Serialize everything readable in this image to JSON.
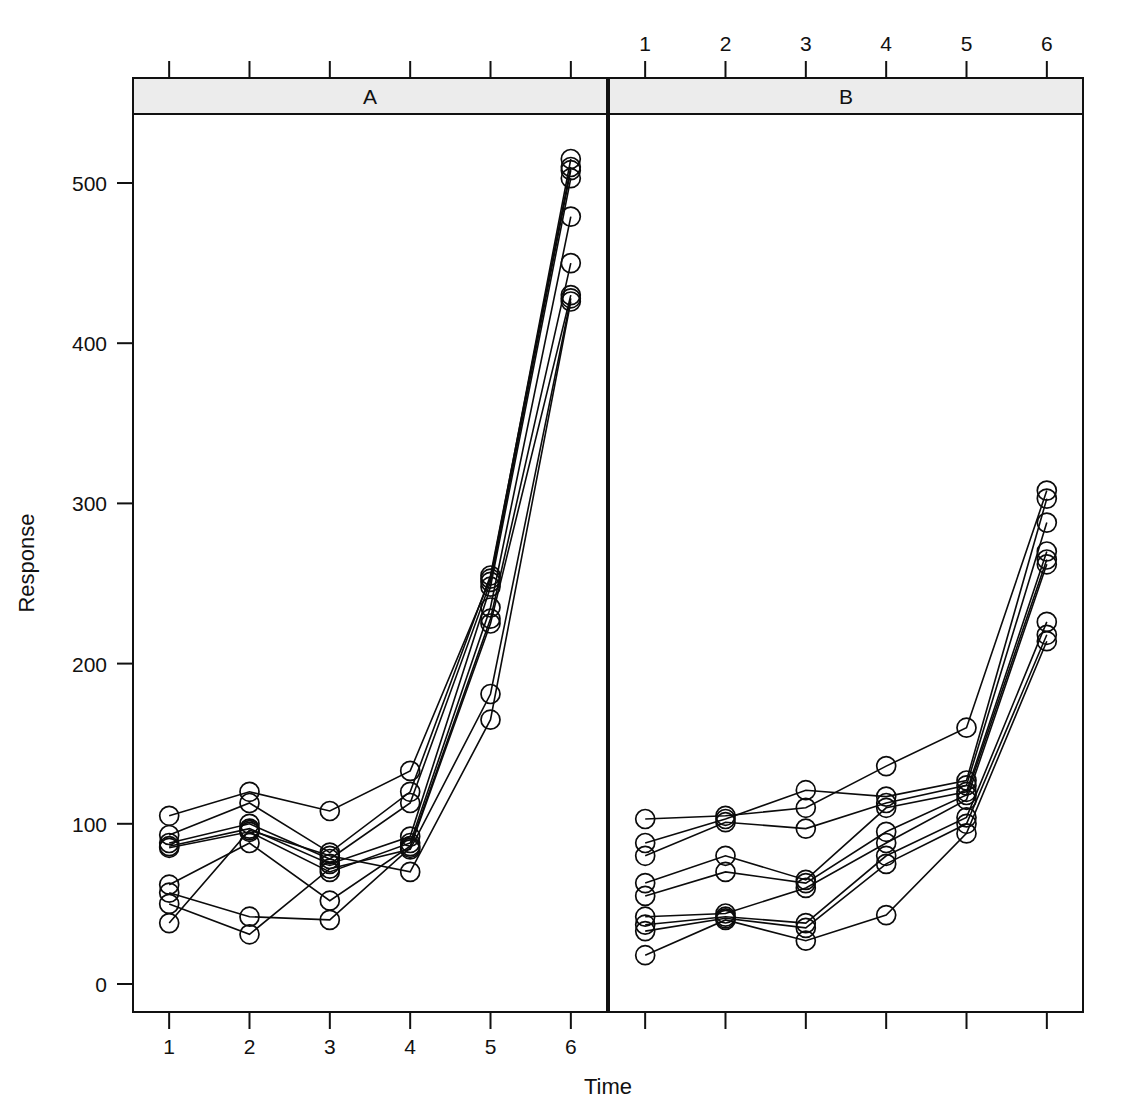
{
  "figure": {
    "title": "",
    "panels": [
      {
        "id": "A",
        "strip_label": "A"
      },
      {
        "id": "B",
        "strip_label": "B"
      }
    ],
    "axis": {
      "x_title": "Time",
      "y_title": "Response",
      "x_ticks": [
        "1",
        "2",
        "3",
        "4",
        "5",
        "6"
      ],
      "y_ticks": [
        "0",
        "100",
        "200",
        "300",
        "400",
        "500"
      ]
    }
  },
  "chart_data": {
    "type": "line",
    "title": "",
    "xlabel": "Time",
    "ylabel": "Response",
    "x": [
      1,
      2,
      3,
      4,
      5,
      6
    ],
    "xlim": [
      0.55,
      6.45
    ],
    "ylim": [
      0,
      545
    ],
    "grid": false,
    "legend_position": "none",
    "marker": "open-circle",
    "panel_layout": "1x2",
    "panels": [
      {
        "name": "A",
        "strip_label": "A",
        "x_axis_position": "bottom",
        "x_tick_labels": [
          "1",
          "2",
          "3",
          "4",
          "5",
          "6"
        ],
        "series": [
          {
            "name": "A-s1",
            "values": [
              105,
              120,
              108,
              133,
              253,
              515
            ]
          },
          {
            "name": "A-s2",
            "values": [
              93,
              113,
              82,
              120,
              255,
              510
            ]
          },
          {
            "name": "A-s3",
            "values": [
              88,
              100,
              78,
              113,
              251,
              508
            ]
          },
          {
            "name": "A-s4",
            "values": [
              86,
              97,
              75,
              92,
              248,
              503
            ]
          },
          {
            "name": "A-s5",
            "values": [
              85,
              95,
              70,
              88,
              235,
              479
            ]
          },
          {
            "name": "A-s6",
            "values": [
              62,
              88,
              52,
              86,
              228,
              450
            ]
          },
          {
            "name": "A-s7",
            "values": [
              57,
              42,
              40,
              85,
              225,
              430
            ]
          },
          {
            "name": "A-s8",
            "values": [
              50,
              31,
              72,
              84,
              181,
              428
            ]
          },
          {
            "name": "A-s9",
            "values": [
              38,
              96,
              80,
              70,
              165,
              426
            ]
          }
        ]
      },
      {
        "name": "B",
        "strip_label": "B",
        "x_axis_position": "top",
        "x_tick_labels": [
          "1",
          "2",
          "3",
          "4",
          "5",
          "6"
        ],
        "series": [
          {
            "name": "B-s1",
            "values": [
              103,
              105,
              110,
              136,
              160,
              308
            ]
          },
          {
            "name": "B-s2",
            "values": [
              88,
              103,
              121,
              117,
              127,
              303
            ]
          },
          {
            "name": "B-s3",
            "values": [
              80,
              101,
              97,
              113,
              124,
              288
            ]
          },
          {
            "name": "B-s4",
            "values": [
              63,
              80,
              65,
              110,
              120,
              270
            ]
          },
          {
            "name": "B-s5",
            "values": [
              55,
              70,
              63,
              95,
              118,
              265
            ]
          },
          {
            "name": "B-s6",
            "values": [
              42,
              44,
              60,
              88,
              115,
              262
            ]
          },
          {
            "name": "B-s7",
            "values": [
              37,
              42,
              38,
              80,
              104,
              226
            ]
          },
          {
            "name": "B-s8",
            "values": [
              33,
              41,
              35,
              75,
              100,
              218
            ]
          },
          {
            "name": "B-s9",
            "values": [
              18,
              40,
              27,
              43,
              94,
              214
            ]
          }
        ]
      }
    ]
  }
}
